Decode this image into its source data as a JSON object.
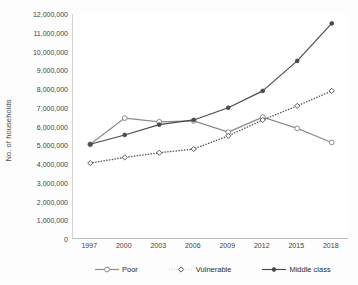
{
  "chart_data": {
    "type": "line",
    "title": "",
    "xlabel": "",
    "ylabel": "No. of households",
    "categories": [
      "1997",
      "2000",
      "2003",
      "2006",
      "2009",
      "2012",
      "2015",
      "2018"
    ],
    "ylim": [
      0,
      12000000
    ],
    "ytick_step": 1000000,
    "yticks": [
      "12,000,000",
      "11,000,000",
      "10,000,000",
      "9,000,000",
      "8,000,000",
      "7,000,000",
      "6,000,000",
      "5,000,000",
      "4,000,000",
      "3,000,000",
      "2,000,000",
      "1,000,000",
      "0"
    ],
    "ytick_values": [
      12000000,
      11000000,
      10000000,
      9000000,
      8000000,
      7000000,
      6000000,
      5000000,
      4000000,
      3000000,
      2000000,
      1000000,
      0
    ],
    "grid": false,
    "legend_position": "bottom",
    "series": [
      {
        "name": "Poor",
        "color": "#8c8c8c",
        "style": "solid",
        "marker": "open-circle",
        "values": [
          5050000,
          6450000,
          6250000,
          6300000,
          5700000,
          6500000,
          5900000,
          5150000
        ]
      },
      {
        "name": "Vulnerable",
        "color": "#585858",
        "style": "dotted",
        "marker": "open-diamond",
        "values": [
          4050000,
          4350000,
          4600000,
          4800000,
          5500000,
          6350000,
          7100000,
          7900000
        ]
      },
      {
        "name": "Middle class",
        "color": "#4a4a4a",
        "style": "solid",
        "marker": "small-circle",
        "values": [
          5050000,
          5550000,
          6100000,
          6350000,
          7000000,
          7900000,
          9500000,
          11500000
        ]
      }
    ]
  },
  "legend": {
    "items": [
      {
        "label": "Poor"
      },
      {
        "label": "Vulnerable"
      },
      {
        "label": "Middle class"
      }
    ]
  }
}
